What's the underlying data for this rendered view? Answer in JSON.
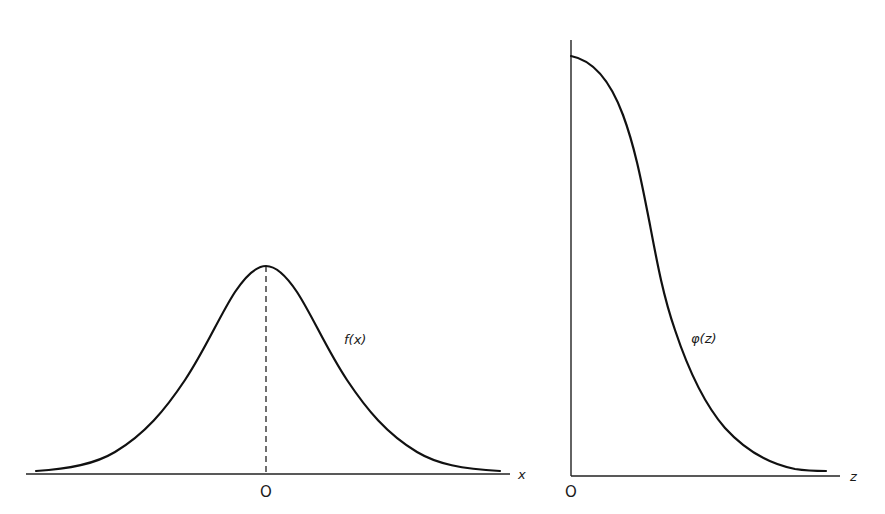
{
  "figure": {
    "left_panel": {
      "curve_label": "f(x)",
      "axis_label": "x",
      "origin_label": "O",
      "description": "Symmetric bell-shaped density f(x) centered at O with dashed vertical line at the peak"
    },
    "right_panel": {
      "curve_label": "φ(z)",
      "axis_label": "z",
      "origin_label": "O",
      "description": "Right half of bell curve φ(z), maximum at z = 0 decreasing toward zero"
    },
    "colors": {
      "line": "#111111",
      "background": "#ffffff"
    }
  }
}
